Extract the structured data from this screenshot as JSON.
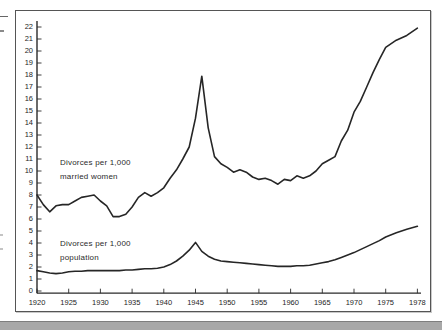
{
  "page": {
    "background": "#ffffff",
    "frame_border_color": "#555555",
    "footer_band_color": "#a8a8a8"
  },
  "chart_data": {
    "type": "line",
    "title": "",
    "xlabel": "",
    "ylabel": "",
    "ylim": [
      0,
      22
    ],
    "grid": false,
    "legend_position": "inline-annotations",
    "line_color": "#262626",
    "axis_color": "#2a2a2a",
    "y_tick_labels": [
      "0",
      "1",
      "2",
      "3",
      "4",
      "5",
      "6",
      "7",
      "8",
      "9",
      "10",
      "11",
      "12",
      "13",
      "14",
      "15",
      "16",
      "17",
      "18",
      "19",
      "20",
      "21",
      "22"
    ],
    "x_tick_labels": [
      "1920",
      "1925",
      "1930",
      "1935",
      "1940",
      "1945",
      "1950",
      "1955",
      "1960",
      "1965",
      "1970",
      "1975",
      "1978"
    ],
    "x_tick_note": "ticks evenly spaced; final 1975-1978 interval drawn same width as the 5-year intervals",
    "series": [
      {
        "name": "Divorces per 1,000 married women",
        "label_lines": [
          "Divorces per 1,000",
          "married women"
        ],
        "years": [
          1920,
          1921,
          1922,
          1923,
          1924,
          1925,
          1926,
          1927,
          1928,
          1929,
          1930,
          1931,
          1932,
          1933,
          1934,
          1935,
          1936,
          1937,
          1938,
          1939,
          1940,
          1941,
          1942,
          1943,
          1944,
          1945,
          1946,
          1947,
          1948,
          1949,
          1950,
          1951,
          1952,
          1953,
          1954,
          1955,
          1956,
          1957,
          1958,
          1959,
          1960,
          1961,
          1962,
          1963,
          1964,
          1965,
          1966,
          1967,
          1968,
          1969,
          1970,
          1971,
          1972,
          1973,
          1974,
          1975,
          1976,
          1977,
          1978
        ],
        "values": [
          8.0,
          7.2,
          6.6,
          7.1,
          7.2,
          7.2,
          7.5,
          7.8,
          7.9,
          8.0,
          7.5,
          7.1,
          6.2,
          6.2,
          6.4,
          7.0,
          7.8,
          8.2,
          7.9,
          8.2,
          8.6,
          9.4,
          10.1,
          11.0,
          12.0,
          14.4,
          17.9,
          13.6,
          11.2,
          10.6,
          10.3,
          9.9,
          10.1,
          9.9,
          9.5,
          9.3,
          9.4,
          9.2,
          8.9,
          9.3,
          9.2,
          9.6,
          9.4,
          9.6,
          10.0,
          10.6,
          10.9,
          11.2,
          12.5,
          13.4,
          14.9,
          15.8,
          17.0,
          18.2,
          19.3,
          20.3,
          20.9,
          21.3,
          21.9
        ]
      },
      {
        "name": "Divorces per 1,000 population",
        "label_lines": [
          "Divorces per 1,000",
          "population"
        ],
        "years": [
          1920,
          1921,
          1922,
          1923,
          1924,
          1925,
          1926,
          1927,
          1928,
          1929,
          1930,
          1931,
          1932,
          1933,
          1934,
          1935,
          1936,
          1937,
          1938,
          1939,
          1940,
          1941,
          1942,
          1943,
          1944,
          1945,
          1946,
          1947,
          1948,
          1949,
          1950,
          1951,
          1952,
          1953,
          1954,
          1955,
          1956,
          1957,
          1958,
          1959,
          1960,
          1961,
          1962,
          1963,
          1964,
          1965,
          1966,
          1967,
          1968,
          1969,
          1970,
          1971,
          1972,
          1973,
          1974,
          1975,
          1976,
          1977,
          1978
        ],
        "values": [
          1.7,
          1.6,
          1.5,
          1.45,
          1.5,
          1.6,
          1.65,
          1.65,
          1.7,
          1.7,
          1.7,
          1.7,
          1.7,
          1.7,
          1.75,
          1.75,
          1.8,
          1.85,
          1.85,
          1.9,
          2.0,
          2.2,
          2.5,
          2.9,
          3.4,
          4.05,
          3.3,
          2.9,
          2.65,
          2.5,
          2.45,
          2.4,
          2.35,
          2.3,
          2.25,
          2.2,
          2.15,
          2.1,
          2.05,
          2.05,
          2.05,
          2.1,
          2.1,
          2.15,
          2.25,
          2.35,
          2.45,
          2.6,
          2.8,
          3.0,
          3.2,
          3.45,
          3.7,
          3.95,
          4.2,
          4.5,
          4.85,
          5.15,
          5.4
        ]
      }
    ]
  }
}
